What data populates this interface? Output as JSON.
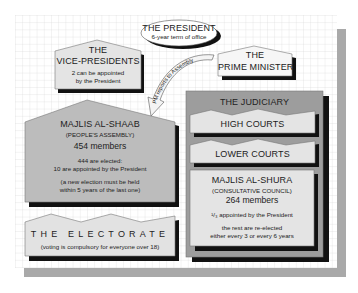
{
  "diagram": {
    "colors": {
      "grid_background": "#ffffff",
      "grid_lines": "#d9d9d9",
      "panel_shadow": "#a8a8a8",
      "box_fill_light": "#e6e6e6",
      "box_fill_mid": "#bdbdbd",
      "judiciary_fill": "#9e9e9e",
      "drop_shadow": "#111111",
      "text": "#222222"
    },
    "president": {
      "title": "THE PRESIDENT",
      "subtitle": "6-year term of office"
    },
    "vice_presidents": {
      "title_line1": "THE",
      "title_line2": "VICE-PRESIDENTS",
      "note_line1": "2 can be appointed",
      "note_line2": "by the President"
    },
    "prime_minister": {
      "title_line1": "THE",
      "title_line2": "PRIME MINISTER"
    },
    "arrow": {
      "label": "PM reports to Assembly"
    },
    "majlis_al_shaab": {
      "title": "MAJLIS AL-SHAAB",
      "subtitle": "(PEOPLE'S ASSEMBLY)",
      "members": "454 members",
      "note1_line1": "444 are elected:",
      "note1_line2": "10 are appointed by the President",
      "note2_line1": "(a new election must be held",
      "note2_line2": "within 5 years of the last one)"
    },
    "electorate": {
      "title": "THE ELECTORATE",
      "note": "(voting is compulsory for everyone over 18)"
    },
    "judiciary": {
      "title": "THE JUDICIARY",
      "high_courts": "HIGH COURTS",
      "lower_courts": "LOWER COURTS"
    },
    "majlis_al_shura": {
      "title": "MAJLIS AL-SHURA",
      "subtitle": "(CONSULTATIVE COUNCIL)",
      "members": "264 members",
      "note1": "¹/₃ appointed by the President",
      "note2_line1": "the rest are re-elected",
      "note2_line2": "either every 3 or every 6 years"
    }
  }
}
